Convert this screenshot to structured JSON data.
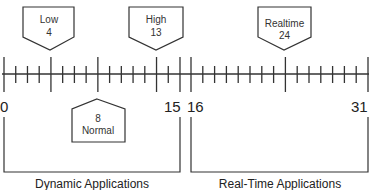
{
  "diagram": {
    "scale": {
      "min": 0,
      "max": 31,
      "x_start": 4,
      "x_end": 368
    },
    "endpoint_labels": [
      {
        "value": "0",
        "x": 4
      },
      {
        "value": "15",
        "x": 180
      },
      {
        "value": "16",
        "x": 191
      },
      {
        "value": "31",
        "x": 368
      }
    ],
    "callouts": [
      {
        "name": "low",
        "label": "Low",
        "value": "4",
        "position": "above"
      },
      {
        "name": "high",
        "label": "High",
        "value": "13",
        "position": "above"
      },
      {
        "name": "realtime",
        "label": "Realtime",
        "value": "24",
        "position": "above"
      },
      {
        "name": "normal",
        "label": "Normal",
        "value": "8",
        "position": "below"
      }
    ],
    "groups": [
      {
        "name": "dynamic",
        "label": "Dynamic Applications",
        "range": [
          0,
          15
        ]
      },
      {
        "name": "realtime",
        "label": "Real-Time Applications",
        "range": [
          16,
          31
        ]
      }
    ],
    "colors": {
      "stroke": "#333333",
      "background": "#ffffff"
    }
  }
}
